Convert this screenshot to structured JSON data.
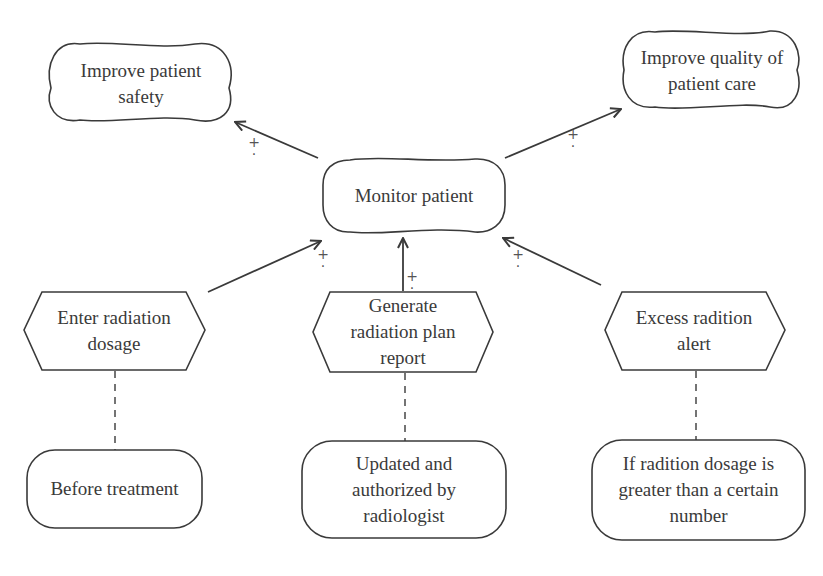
{
  "diagram": {
    "type": "goal-model",
    "softgoals": [
      {
        "id": "improve-safety",
        "label": "Improve patient\nsafety"
      },
      {
        "id": "improve-quality",
        "label": "Improve quality of\npatient care"
      }
    ],
    "goal": {
      "id": "monitor-patient",
      "label": "Monitor patient"
    },
    "tasks": [
      {
        "id": "enter-dosage",
        "label": "Enter radiation\ndosage"
      },
      {
        "id": "generate-report",
        "label": "Generate\nradiation plan\nreport"
      },
      {
        "id": "excess-alert",
        "label": "Excess radition\nalert"
      }
    ],
    "notes": [
      {
        "id": "note-before-treatment",
        "label": "Before treatment"
      },
      {
        "id": "note-updated-authorized",
        "label": "Updated and\nauthorized by\nradiologist"
      },
      {
        "id": "note-if-greater",
        "label": "If radition dosage is\ngreater than a certain\nnumber"
      }
    ],
    "contribution_mark": "+",
    "links": [
      {
        "from": "monitor-patient",
        "to": "improve-safety",
        "type": "contribution",
        "mark": "+"
      },
      {
        "from": "monitor-patient",
        "to": "improve-quality",
        "type": "contribution",
        "mark": "+"
      },
      {
        "from": "enter-dosage",
        "to": "monitor-patient",
        "type": "contribution",
        "mark": "+"
      },
      {
        "from": "generate-report",
        "to": "monitor-patient",
        "type": "contribution",
        "mark": "+"
      },
      {
        "from": "excess-alert",
        "to": "monitor-patient",
        "type": "contribution",
        "mark": "+"
      },
      {
        "from": "enter-dosage",
        "to": "note-before-treatment",
        "type": "annotation"
      },
      {
        "from": "generate-report",
        "to": "note-updated-authorized",
        "type": "annotation"
      },
      {
        "from": "excess-alert",
        "to": "note-if-greater",
        "type": "annotation"
      }
    ],
    "colors": {
      "stroke": "#3a3a3a",
      "text": "#3a3a3a",
      "background": "#ffffff"
    }
  }
}
